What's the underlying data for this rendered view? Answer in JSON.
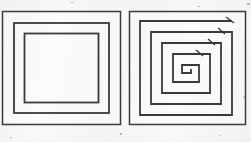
{
  "figure": {
    "background_color": "#fbfbfa",
    "stroke_color": "#3a3a3a",
    "width": 251,
    "height": 142,
    "panels": [
      {
        "id": "left",
        "name": "concentric-squares",
        "label": "",
        "description": "Three separate nested (concentric) squares, each a closed outline",
        "shape_type": "concentric-closed-squares",
        "ring_count": 3,
        "stroke_color": "#3a3a3a",
        "rings": [
          {
            "x": 2.5,
            "y": 11.5,
            "size": 118,
            "stroke_width": 1.5
          },
          {
            "x": 14.0,
            "y": 23.0,
            "size": 95,
            "stroke_width": 1.8
          },
          {
            "x": 24.5,
            "y": 33.5,
            "size": 74,
            "stroke_width": 1.8
          }
        ]
      },
      {
        "id": "right",
        "name": "square-spiral",
        "label": "",
        "description": "A single continuous line wound inward as a square spiral with five turns",
        "shape_type": "square-spiral",
        "turn_count": 5,
        "stroke_color": "#3a3a3a",
        "stroke_width": 1.8,
        "outer_square": {
          "x": 3.5,
          "y": 11.5,
          "size": 116,
          "stroke_width": 1.5
        },
        "spiral_start": {
          "x": 107,
          "y": 22
        },
        "spiral_step": 11,
        "spiral_center": {
          "x": 61,
          "y": 68
        }
      }
    ],
    "caption_mark": "-",
    "specks": [
      {
        "x": 247,
        "y": 3,
        "w": 3,
        "h": 2
      },
      {
        "x": 243,
        "y": 96,
        "w": 2,
        "h": 2
      },
      {
        "x": 10,
        "y": 137,
        "w": 2,
        "h": 1
      },
      {
        "x": 120,
        "y": 133,
        "w": 2,
        "h": 2
      },
      {
        "x": 198,
        "y": 6,
        "w": 2,
        "h": 1
      },
      {
        "x": 71,
        "y": 2,
        "w": 2,
        "h": 1
      }
    ]
  }
}
